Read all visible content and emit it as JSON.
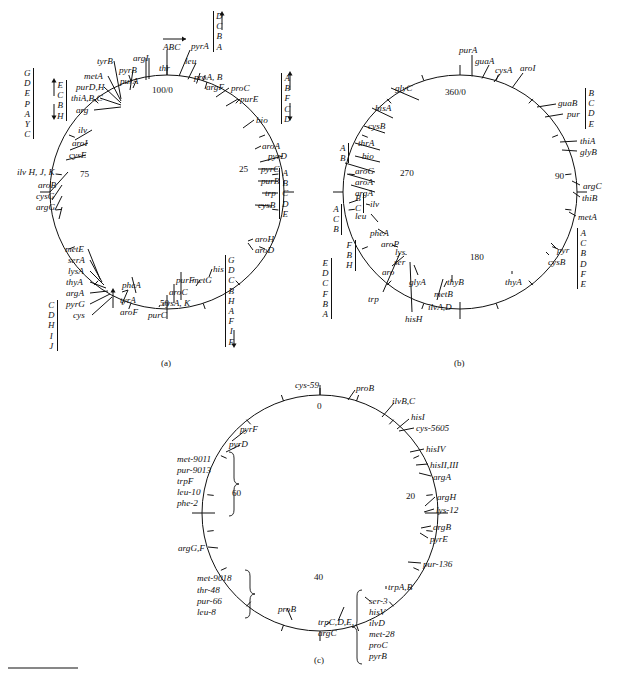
{
  "figure": {
    "panels": [
      "(a)",
      "(b)",
      "(c)"
    ],
    "bottom_rule": true
  },
  "map_a": {
    "caption": "(a)",
    "center": {
      "x": 167,
      "y": 192
    },
    "radius": 117,
    "origin_label": "100/0",
    "scale_labels": [
      "100/0",
      "25",
      "50",
      "75"
    ],
    "operon_columns": [
      {
        "name": "col-left-outer",
        "letters": [
          "G",
          "D",
          "E",
          "P",
          "A",
          "Y",
          "C"
        ],
        "x": 24,
        "y": 68,
        "bar": "right"
      },
      {
        "name": "col-left-inner",
        "letters": [
          "E",
          "C",
          "B",
          "H"
        ],
        "x": 57,
        "y": 80,
        "bar": "right",
        "arrows": "updown"
      },
      {
        "name": "col-cys-lower-left",
        "letters": [
          "C",
          "D",
          "H",
          "I",
          "J"
        ],
        "x": 48,
        "y": 300,
        "bar": "right"
      },
      {
        "name": "col-his-right",
        "letters": [
          "G",
          "D",
          "C",
          "B",
          "H",
          "A",
          "F",
          "I",
          "E"
        ],
        "x": 225,
        "y": 255,
        "bar": "left",
        "arrow_end": "down"
      },
      {
        "name": "col-trp-right",
        "letters": [
          "A",
          "B",
          "C",
          "D",
          "E"
        ],
        "x": 279,
        "y": 168,
        "bar": "left"
      },
      {
        "name": "col-bio-right",
        "letters": [
          "A",
          "B",
          "F",
          "C",
          "D"
        ],
        "x": 281,
        "y": 73,
        "bar": "left",
        "arrows": "updown"
      },
      {
        "name": "col-pyrA-top",
        "letters": [
          "D",
          "C",
          "B",
          "A"
        ],
        "x": 213,
        "y": 11,
        "bar": "left",
        "arrow_end": "up"
      }
    ],
    "gene_labels": [
      {
        "text": "100/0",
        "x": 152,
        "y": 86,
        "italic": false
      },
      {
        "text": "25",
        "x": 239,
        "y": 165,
        "italic": false
      },
      {
        "text": "50",
        "x": 160,
        "y": 299,
        "italic": false
      },
      {
        "text": "75",
        "x": 80,
        "y": 170,
        "italic": false
      },
      {
        "text": "ABC",
        "x": 163,
        "y": 43,
        "italic": true
      },
      {
        "text": "thr",
        "x": 159,
        "y": 64,
        "italic": true
      },
      {
        "text": "pyrA",
        "x": 191,
        "y": 42,
        "italic": true
      },
      {
        "text": "leu",
        "x": 185,
        "y": 57,
        "italic": true
      },
      {
        "text": "proA, B",
        "x": 194,
        "y": 73,
        "italic": true
      },
      {
        "text": "argF",
        "x": 206,
        "y": 83,
        "italic": true
      },
      {
        "text": "proC",
        "x": 231,
        "y": 84,
        "italic": true
      },
      {
        "text": "purE",
        "x": 240,
        "y": 95,
        "italic": true
      },
      {
        "text": "bio",
        "x": 256,
        "y": 116,
        "italic": true
      },
      {
        "text": "aroA",
        "x": 262,
        "y": 142,
        "italic": true
      },
      {
        "text": "pyrD",
        "x": 268,
        "y": 152,
        "italic": true
      },
      {
        "text": "pyrC",
        "x": 261,
        "y": 165,
        "italic": true
      },
      {
        "text": "purB",
        "x": 261,
        "y": 177,
        "italic": true
      },
      {
        "text": "trp",
        "x": 265,
        "y": 189,
        "italic": true
      },
      {
        "text": "cysB",
        "x": 258,
        "y": 201,
        "italic": true
      },
      {
        "text": "aroH",
        "x": 255,
        "y": 235,
        "italic": true
      },
      {
        "text": "aroD",
        "x": 255,
        "y": 246,
        "italic": true
      },
      {
        "text": "his",
        "x": 213,
        "y": 265,
        "italic": true
      },
      {
        "text": "metG",
        "x": 192,
        "y": 276,
        "italic": true
      },
      {
        "text": "purF",
        "x": 176,
        "y": 276,
        "italic": true
      },
      {
        "text": "aroC",
        "x": 169,
        "y": 288,
        "italic": true
      },
      {
        "text": "cysA, K",
        "x": 162,
        "y": 299,
        "italic": true
      },
      {
        "text": "purC",
        "x": 148,
        "y": 311,
        "italic": true
      },
      {
        "text": "pheA",
        "x": 122,
        "y": 281,
        "italic": true
      },
      {
        "text": "tyrA",
        "x": 120,
        "y": 296,
        "italic": true
      },
      {
        "text": "aroF",
        "x": 120,
        "y": 308,
        "italic": true
      },
      {
        "text": "metE",
        "x": 65,
        "y": 245,
        "italic": true
      },
      {
        "text": "serA",
        "x": 68,
        "y": 256,
        "italic": true
      },
      {
        "text": "lysA",
        "x": 68,
        "y": 267,
        "italic": true
      },
      {
        "text": "thyA",
        "x": 66,
        "y": 278,
        "italic": true
      },
      {
        "text": "argA",
        "x": 66,
        "y": 289,
        "italic": true
      },
      {
        "text": "pyrG",
        "x": 66,
        "y": 300,
        "italic": true
      },
      {
        "text": "cys",
        "x": 73,
        "y": 311,
        "italic": true
      },
      {
        "text": "ilv H, J, K",
        "x": 17,
        "y": 168,
        "italic": true
      },
      {
        "text": "aroB",
        "x": 38,
        "y": 181,
        "italic": true
      },
      {
        "text": "cysG",
        "x": 36,
        "y": 192,
        "italic": true
      },
      {
        "text": "argG",
        "x": 36,
        "y": 203,
        "italic": true
      },
      {
        "text": "ilv",
        "x": 78,
        "y": 126,
        "italic": true
      },
      {
        "text": "aroI",
        "x": 72,
        "y": 139,
        "italic": true
      },
      {
        "text": "cysE",
        "x": 69,
        "y": 151,
        "italic": true
      },
      {
        "text": "arg",
        "x": 76,
        "y": 106,
        "italic": true
      },
      {
        "text": "thiA,B,C",
        "x": 71,
        "y": 94,
        "italic": true
      },
      {
        "text": "purD,H",
        "x": 76,
        "y": 83,
        "italic": true
      },
      {
        "text": "metA",
        "x": 84,
        "y": 72,
        "italic": true
      },
      {
        "text": "tyrB",
        "x": 97,
        "y": 57,
        "italic": true
      },
      {
        "text": "pyrB",
        "x": 119,
        "y": 66,
        "italic": true
      },
      {
        "text": "purA",
        "x": 120,
        "y": 77,
        "italic": true
      },
      {
        "text": "argI",
        "x": 133,
        "y": 54,
        "italic": true
      }
    ]
  },
  "map_b": {
    "caption": "(b)",
    "center": {
      "x": 460,
      "y": 192
    },
    "radius": 117,
    "origin_label": "360/0",
    "scale_labels": [
      "360/0",
      "90",
      "180",
      "270"
    ],
    "operon_columns": [
      {
        "name": "col-pur-right",
        "letters": [
          "B",
          "C",
          "D",
          "E"
        ],
        "x": 585,
        "y": 88,
        "bar": "left"
      },
      {
        "name": "col-pyr-right",
        "letters": [
          "A",
          "C",
          "B",
          "D",
          "F",
          "E"
        ],
        "x": 577,
        "y": 228,
        "bar": "left"
      },
      {
        "name": "col-bio-left",
        "letters": [
          "A",
          "B"
        ],
        "x": 340,
        "y": 143,
        "bar": "right"
      },
      {
        "name": "col-ilv-left",
        "letters": [
          "B",
          "C"
        ],
        "x": 355,
        "y": 193,
        "bar": "right"
      },
      {
        "name": "col-leu-left",
        "letters": [
          "A",
          "C",
          "B"
        ],
        "x": 333,
        "y": 204,
        "bar": "right"
      },
      {
        "name": "col-aro-left",
        "letters": [
          "F",
          "B",
          "H"
        ],
        "x": 346,
        "y": 240,
        "bar": "right"
      },
      {
        "name": "col-trp-left",
        "letters": [
          "E",
          "D",
          "C",
          "F",
          "B",
          "A"
        ],
        "x": 322,
        "y": 258,
        "bar": "right"
      }
    ],
    "gene_labels": [
      {
        "text": "360/0",
        "x": 445,
        "y": 88,
        "italic": false
      },
      {
        "text": "90",
        "x": 555,
        "y": 172,
        "italic": false
      },
      {
        "text": "180",
        "x": 470,
        "y": 253,
        "italic": false
      },
      {
        "text": "270",
        "x": 400,
        "y": 169,
        "italic": false
      },
      {
        "text": "purA",
        "x": 459,
        "y": 46,
        "italic": true
      },
      {
        "text": "guaA",
        "x": 475,
        "y": 57,
        "italic": true
      },
      {
        "text": "cysA",
        "x": 495,
        "y": 66,
        "italic": true
      },
      {
        "text": "aroI",
        "x": 520,
        "y": 64,
        "italic": true
      },
      {
        "text": "guaB",
        "x": 558,
        "y": 99,
        "italic": true
      },
      {
        "text": "pur",
        "x": 567,
        "y": 110,
        "italic": true
      },
      {
        "text": "thiA",
        "x": 580,
        "y": 137,
        "italic": true
      },
      {
        "text": "glyB",
        "x": 580,
        "y": 148,
        "italic": true
      },
      {
        "text": "argC",
        "x": 583,
        "y": 182,
        "italic": true
      },
      {
        "text": "thiB",
        "x": 582,
        "y": 194,
        "italic": true
      },
      {
        "text": "metA",
        "x": 578,
        "y": 213,
        "italic": true
      },
      {
        "text": "pyr",
        "x": 557,
        "y": 246,
        "italic": true
      },
      {
        "text": "cysB",
        "x": 548,
        "y": 258,
        "italic": true
      },
      {
        "text": "thyA",
        "x": 505,
        "y": 278,
        "italic": true
      },
      {
        "text": "thyB",
        "x": 447,
        "y": 278,
        "italic": true
      },
      {
        "text": "metB",
        "x": 434,
        "y": 290,
        "italic": true
      },
      {
        "text": "ilvA,D",
        "x": 428,
        "y": 303,
        "italic": true
      },
      {
        "text": "hisH",
        "x": 405,
        "y": 315,
        "italic": true
      },
      {
        "text": "glyA",
        "x": 409,
        "y": 278,
        "italic": true
      },
      {
        "text": "trp",
        "x": 368,
        "y": 295,
        "italic": true
      },
      {
        "text": "aro",
        "x": 382,
        "y": 268,
        "italic": true
      },
      {
        "text": "ser",
        "x": 394,
        "y": 258,
        "italic": true
      },
      {
        "text": "lys",
        "x": 395,
        "y": 248,
        "italic": true
      },
      {
        "text": "aroP",
        "x": 381,
        "y": 240,
        "italic": true
      },
      {
        "text": "pheA",
        "x": 370,
        "y": 229,
        "italic": true
      },
      {
        "text": "ilv",
        "x": 370,
        "y": 200,
        "italic": true
      },
      {
        "text": "leu",
        "x": 355,
        "y": 212,
        "italic": true
      },
      {
        "text": "argA",
        "x": 355,
        "y": 189,
        "italic": true
      },
      {
        "text": "aroA",
        "x": 355,
        "y": 178,
        "italic": true
      },
      {
        "text": "aroG",
        "x": 355,
        "y": 167,
        "italic": true
      },
      {
        "text": "bio",
        "x": 362,
        "y": 152,
        "italic": true
      },
      {
        "text": "thrA",
        "x": 358,
        "y": 139,
        "italic": true
      },
      {
        "text": "cysB",
        "x": 368,
        "y": 122,
        "italic": true
      },
      {
        "text": "hisA",
        "x": 375,
        "y": 104,
        "italic": true
      },
      {
        "text": "glyC",
        "x": 395,
        "y": 84,
        "italic": true
      }
    ]
  },
  "map_c": {
    "caption": "(c)",
    "center": {
      "x": 320,
      "y": 513
    },
    "radius": 118,
    "origin_label": "0",
    "scale_labels": [
      "0",
      "20",
      "40",
      "60"
    ],
    "gene_labels": [
      {
        "text": "0",
        "x": 317,
        "y": 402,
        "italic": false
      },
      {
        "text": "20",
        "x": 406,
        "y": 492,
        "italic": false
      },
      {
        "text": "40",
        "x": 314,
        "y": 573,
        "italic": false
      },
      {
        "text": "60",
        "x": 232,
        "y": 489,
        "italic": false
      },
      {
        "text": "cys-59",
        "x": 295,
        "y": 381,
        "italic": true
      },
      {
        "text": "proB",
        "x": 356,
        "y": 384,
        "italic": true
      },
      {
        "text": "ilvB,C",
        "x": 392,
        "y": 397,
        "italic": true
      },
      {
        "text": "hisI",
        "x": 411,
        "y": 413,
        "italic": true
      },
      {
        "text": "cys-5605",
        "x": 416,
        "y": 424,
        "italic": true
      },
      {
        "text": "hisIV",
        "x": 426,
        "y": 445,
        "italic": true
      },
      {
        "text": "hisII,III",
        "x": 430,
        "y": 461,
        "italic": true
      },
      {
        "text": "argA",
        "x": 433,
        "y": 473,
        "italic": true
      },
      {
        "text": "argH",
        "x": 437,
        "y": 493,
        "italic": true
      },
      {
        "text": "lys-12",
        "x": 436,
        "y": 506,
        "italic": true
      },
      {
        "text": "argB",
        "x": 433,
        "y": 523,
        "italic": true
      },
      {
        "text": "pyrE",
        "x": 430,
        "y": 535,
        "italic": true
      },
      {
        "text": "pur-136",
        "x": 423,
        "y": 560,
        "italic": true
      },
      {
        "text": "trpA,B",
        "x": 388,
        "y": 583,
        "italic": true
      },
      {
        "text": "ser-3",
        "x": 369,
        "y": 597,
        "italic": true
      },
      {
        "text": "hisV",
        "x": 369,
        "y": 608,
        "italic": true
      },
      {
        "text": "ilvD",
        "x": 369,
        "y": 619,
        "italic": true
      },
      {
        "text": "met-28",
        "x": 369,
        "y": 630,
        "italic": true
      },
      {
        "text": "proC",
        "x": 369,
        "y": 641,
        "italic": true
      },
      {
        "text": "pyrB",
        "x": 369,
        "y": 652,
        "italic": true
      },
      {
        "text": "trpC,D,E,",
        "x": 318,
        "y": 618,
        "italic": true
      },
      {
        "text": "argC",
        "x": 318,
        "y": 629,
        "italic": true
      },
      {
        "text": "proB",
        "x": 278,
        "y": 605,
        "italic": true
      },
      {
        "text": "met-9018",
        "x": 197,
        "y": 574,
        "italic": true
      },
      {
        "text": "thr-48",
        "x": 197,
        "y": 586,
        "italic": true
      },
      {
        "text": "pur-66",
        "x": 197,
        "y": 597,
        "italic": true
      },
      {
        "text": "leu-8",
        "x": 197,
        "y": 608,
        "italic": true
      },
      {
        "text": "argG,F",
        "x": 178,
        "y": 544,
        "italic": true
      },
      {
        "text": "met-9011",
        "x": 177,
        "y": 455,
        "italic": true
      },
      {
        "text": "pur-9013",
        "x": 177,
        "y": 466,
        "italic": true
      },
      {
        "text": "trpF",
        "x": 177,
        "y": 477,
        "italic": true
      },
      {
        "text": "leu-10",
        "x": 177,
        "y": 488,
        "italic": true
      },
      {
        "text": "phe-2",
        "x": 177,
        "y": 499,
        "italic": true
      },
      {
        "text": "pyrF",
        "x": 240,
        "y": 425,
        "italic": true
      },
      {
        "text": "pyrD",
        "x": 229,
        "y": 440,
        "italic": true
      }
    ]
  }
}
